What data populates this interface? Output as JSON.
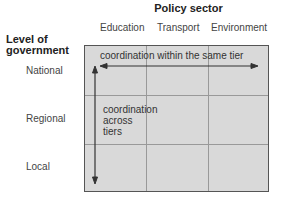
{
  "title": "Policy sector",
  "columns": [
    "Education",
    "Transport",
    "Environment"
  ],
  "row_header": "Level of government",
  "rows": [
    "National",
    "Regional",
    "Local"
  ],
  "horizontal_label": "coordination within the same tier",
  "vertical_label": "coordination across tiers"
}
